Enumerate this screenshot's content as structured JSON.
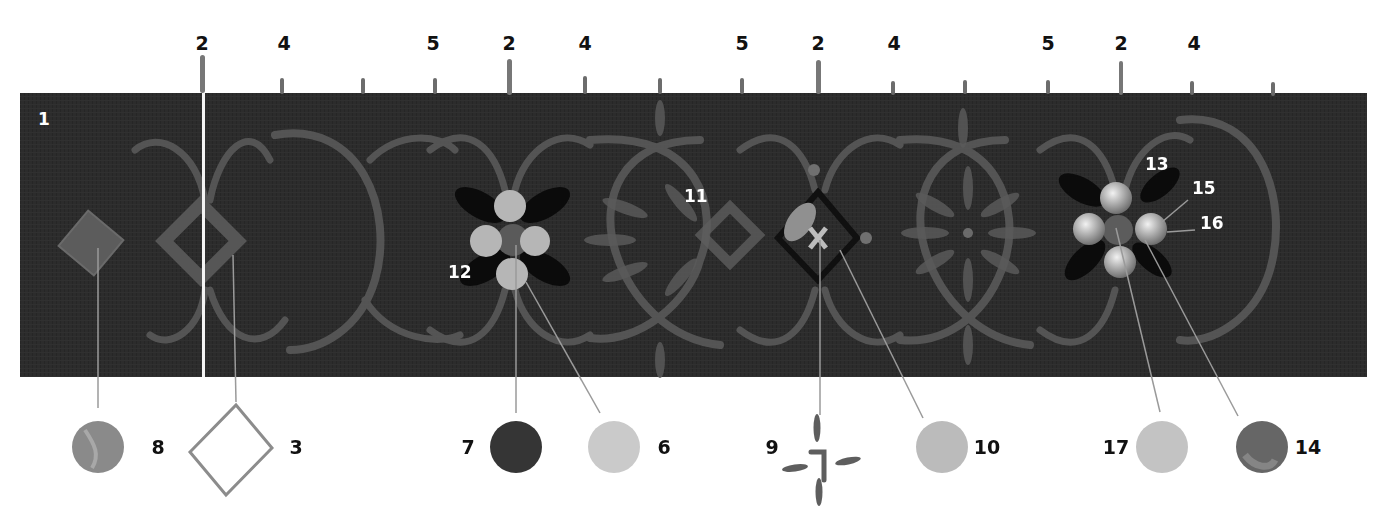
{
  "figure": {
    "type": "annotated painted border (stroke guide)",
    "palette": {
      "background": "#2b2b2b",
      "scroll_stroke": "#5e5e5e",
      "leaf_dark": "#0c0c0c",
      "flower_light": "#b8b8b8",
      "flower_center": "#5a5a5a",
      "callout_line": "#9a9a9a",
      "label_dark": "#111111",
      "label_light": "#ffffff"
    }
  },
  "top_labels": [
    {
      "id": "t1",
      "text": "2",
      "x": 202
    },
    {
      "id": "t2",
      "text": "4",
      "x": 284
    },
    {
      "id": "t3",
      "text": "5",
      "x": 433
    },
    {
      "id": "t4",
      "text": "2",
      "x": 509
    },
    {
      "id": "t5",
      "text": "4",
      "x": 585
    },
    {
      "id": "t6",
      "text": "5",
      "x": 742
    },
    {
      "id": "t7",
      "text": "2",
      "x": 818
    },
    {
      "id": "t8",
      "text": "4",
      "x": 894
    },
    {
      "id": "t9",
      "text": "5",
      "x": 1048
    },
    {
      "id": "t10",
      "text": "2",
      "x": 1121
    },
    {
      "id": "t11",
      "text": "4",
      "x": 1194
    }
  ],
  "board_labels": [
    {
      "id": "b1",
      "text": "1",
      "x": 38,
      "y": 118
    },
    {
      "id": "b11",
      "text": "11",
      "x": 684,
      "y": 196
    },
    {
      "id": "b12",
      "text": "12",
      "x": 448,
      "y": 272
    },
    {
      "id": "b13",
      "text": "13",
      "x": 1145,
      "y": 163
    },
    {
      "id": "b15",
      "text": "15",
      "x": 1192,
      "y": 187
    },
    {
      "id": "b16",
      "text": "16",
      "x": 1200,
      "y": 222
    }
  ],
  "swatches": [
    {
      "id": "s8",
      "label": "8",
      "shape": "circle",
      "fill": "#8a8a8a",
      "cx": 98,
      "cy": 447,
      "label_x": 158
    },
    {
      "id": "s3",
      "label": "3",
      "shape": "diamond-outline",
      "fill": "#8c8c8c",
      "cx": 233,
      "cy": 445,
      "label_x": 296
    },
    {
      "id": "s7",
      "label": "7",
      "shape": "circle",
      "fill": "#3a3a3a",
      "cx": 516,
      "cy": 447,
      "label_x": 468
    },
    {
      "id": "s6",
      "label": "6",
      "shape": "circle",
      "fill": "#c9c9c9",
      "cx": 614,
      "cy": 447,
      "label_x": 664
    },
    {
      "id": "s9",
      "label": "9",
      "shape": "cross-strokes",
      "fill": "#5e5e5e",
      "cx": 822,
      "cy": 460,
      "label_x": 772
    },
    {
      "id": "s10",
      "label": "10",
      "shape": "circle",
      "fill": "#b9b9b9",
      "cx": 942,
      "cy": 447,
      "label_x": 985
    },
    {
      "id": "s17",
      "label": "17",
      "shape": "circle",
      "fill": "#c2c2c2",
      "cx": 1162,
      "cy": 447,
      "label_x": 1116
    },
    {
      "id": "s14",
      "label": "14",
      "shape": "circle",
      "fill": "#6a6a6a",
      "cx": 1262,
      "cy": 447,
      "label_x": 1306
    }
  ]
}
